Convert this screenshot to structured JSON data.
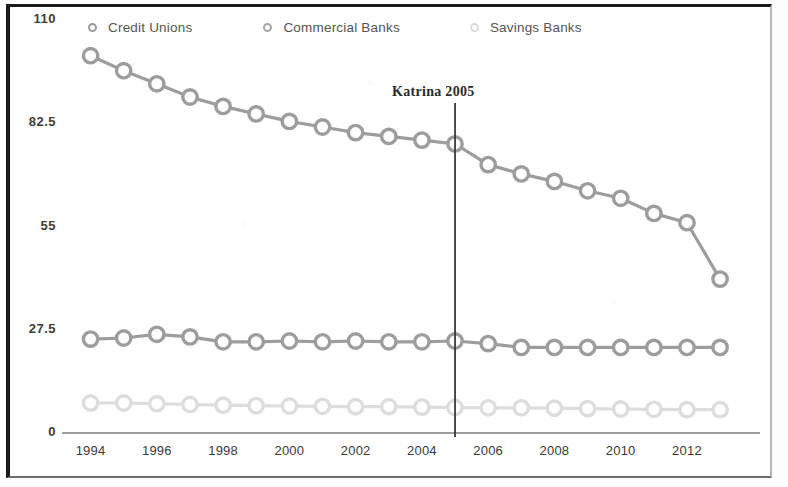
{
  "chart_data": {
    "type": "line",
    "title": "",
    "xlabel": "",
    "ylabel": "",
    "x": [
      1994,
      1995,
      1996,
      1997,
      1998,
      1999,
      2000,
      2001,
      2002,
      2003,
      2004,
      2005,
      2006,
      2007,
      2008,
      2009,
      2010,
      2011,
      2012,
      2013
    ],
    "xlim": [
      1993.5,
      2013.6
    ],
    "ylim": [
      0,
      110
    ],
    "yticks": [
      0,
      27.5,
      55,
      82.5,
      110
    ],
    "ytick_labels": [
      "0",
      "27.5",
      "55",
      "82.5",
      "110"
    ],
    "xtick_values": [
      1994,
      1996,
      1998,
      2000,
      2002,
      2004,
      2006,
      2008,
      2010,
      2012
    ],
    "xtick_labels": [
      "1994",
      "1996",
      "1998",
      "2000",
      "2002",
      "2004",
      "2006",
      "2008",
      "2010",
      "2012"
    ],
    "grid": false,
    "legend_position": "top",
    "series": [
      {
        "name": "Credit Unions",
        "color": "#9d9d9d",
        "marker": "open-circle",
        "values": [
          100.5,
          96.5,
          93.0,
          89.5,
          87.0,
          85.0,
          83.0,
          81.5,
          80.0,
          79.0,
          78.0,
          77.0,
          71.5,
          69.0,
          67.0,
          64.5,
          62.5,
          58.5,
          56.0,
          41.0
        ]
      },
      {
        "name": "Commercial Banks",
        "color": "#9d9d9d",
        "marker": "open-circle",
        "values": [
          25.0,
          25.3,
          26.3,
          25.6,
          24.3,
          24.3,
          24.5,
          24.3,
          24.5,
          24.3,
          24.3,
          24.5,
          23.8,
          22.8,
          22.8,
          22.8,
          22.8,
          22.8,
          22.8,
          22.8
        ]
      },
      {
        "name": "Savings Banks",
        "color": "#dddddd",
        "marker": "open-circle",
        "values": [
          8.0,
          8.0,
          7.8,
          7.6,
          7.4,
          7.3,
          7.2,
          7.1,
          7.0,
          7.0,
          6.9,
          6.8,
          6.7,
          6.7,
          6.6,
          6.5,
          6.4,
          6.3,
          6.2,
          6.2
        ]
      }
    ],
    "annotations": [
      {
        "text": "Katrina 2005",
        "x": 2005,
        "type": "vertical-line-label",
        "line_color": "#3a3a3a",
        "line_top": 103,
        "line_bottom": 437
      }
    ]
  },
  "legend": {
    "entries": [
      {
        "label": "Credit Unions"
      },
      {
        "label": "Commercial Banks"
      },
      {
        "label": "Savings Banks"
      }
    ]
  }
}
